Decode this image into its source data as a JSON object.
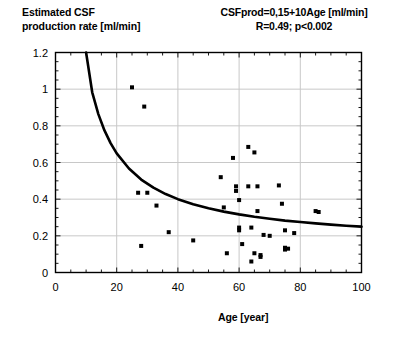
{
  "figure": {
    "ylabel_line1": "Estimated CSF",
    "ylabel_line2": "production rate [ml/min]",
    "ylabel_text": "Estimated CSF\nproduction rate [ml/min]",
    "annotation_line1": "CSFprod=0,15+10Age [ml/min]",
    "annotation_line2": "R=0.49; p<0.002",
    "xlabel": "Age [year]"
  },
  "chart_data": {
    "type": "scatter",
    "title": "",
    "subtitle": "",
    "xlabel": "Age [year]",
    "ylabel": "Estimated CSF production rate [ml/min]",
    "xlim": [
      0,
      100
    ],
    "ylim": [
      0,
      1.2
    ],
    "xticks": [
      0,
      20,
      40,
      60,
      80,
      100
    ],
    "xtick_labels": [
      "0",
      "20",
      "40",
      "60",
      "80",
      "100"
    ],
    "yticks": [
      0,
      0.2,
      0.4,
      0.6,
      0.8,
      1,
      1.2
    ],
    "ytick_labels": [
      "0",
      "0.2",
      "0.4",
      "0.6",
      "0.8",
      "1",
      "1.2"
    ],
    "x_minor_tick_interval": 5,
    "y_minor_tick_interval": 0.05,
    "grid": true,
    "grid_color": "#c8c8c8",
    "frame_color": "#000000",
    "legend": "none",
    "marker_color": "#000000",
    "marker_shape": "square",
    "marker_size_px": 4,
    "annotations": [
      {
        "text": "CSFprod=0,15+10Age [ml/min]",
        "position": "top-right"
      },
      {
        "text": "R=0.49; p<0.002",
        "position": "top-right"
      }
    ],
    "statistics": {
      "R": 0.49,
      "p": "<0.002"
    },
    "points": [
      {
        "x": 25,
        "y": 1.01
      },
      {
        "x": 29,
        "y": 0.905
      },
      {
        "x": 27,
        "y": 0.435
      },
      {
        "x": 30,
        "y": 0.435
      },
      {
        "x": 28,
        "y": 0.145
      },
      {
        "x": 33,
        "y": 0.365
      },
      {
        "x": 37,
        "y": 0.22
      },
      {
        "x": 45,
        "y": 0.175
      },
      {
        "x": 54,
        "y": 0.52
      },
      {
        "x": 55,
        "y": 0.355
      },
      {
        "x": 56,
        "y": 0.105
      },
      {
        "x": 58,
        "y": 0.625
      },
      {
        "x": 59,
        "y": 0.47
      },
      {
        "x": 59,
        "y": 0.445
      },
      {
        "x": 60,
        "y": 0.395
      },
      {
        "x": 60,
        "y": 0.245
      },
      {
        "x": 60,
        "y": 0.23
      },
      {
        "x": 61,
        "y": 0.155
      },
      {
        "x": 63,
        "y": 0.685
      },
      {
        "x": 63,
        "y": 0.47
      },
      {
        "x": 64,
        "y": 0.245
      },
      {
        "x": 64,
        "y": 0.06
      },
      {
        "x": 65,
        "y": 0.655
      },
      {
        "x": 65,
        "y": 0.105
      },
      {
        "x": 66,
        "y": 0.47
      },
      {
        "x": 66,
        "y": 0.335
      },
      {
        "x": 67,
        "y": 0.095
      },
      {
        "x": 67,
        "y": 0.085
      },
      {
        "x": 68,
        "y": 0.205
      },
      {
        "x": 70,
        "y": 0.2
      },
      {
        "x": 73,
        "y": 0.475
      },
      {
        "x": 74,
        "y": 0.375
      },
      {
        "x": 75,
        "y": 0.23
      },
      {
        "x": 75,
        "y": 0.135
      },
      {
        "x": 75,
        "y": 0.125
      },
      {
        "x": 76,
        "y": 0.13
      },
      {
        "x": 78,
        "y": 0.215
      },
      {
        "x": 85,
        "y": 0.335
      },
      {
        "x": 86,
        "y": 0.33
      }
    ],
    "fit_curve": {
      "label": "CSFprod=0,15+10Age [ml/min]",
      "color": "#000000",
      "width_px": 2.6,
      "x_start": 10,
      "x_end": 100,
      "form": "y = 0.15 + 10/x",
      "sample_points": [
        {
          "x": 10,
          "y": 1.2
        },
        {
          "x": 12,
          "y": 0.983
        },
        {
          "x": 14,
          "y": 0.864
        },
        {
          "x": 16,
          "y": 0.775
        },
        {
          "x": 18,
          "y": 0.706
        },
        {
          "x": 20,
          "y": 0.65
        },
        {
          "x": 24,
          "y": 0.567
        },
        {
          "x": 28,
          "y": 0.507
        },
        {
          "x": 32,
          "y": 0.463
        },
        {
          "x": 36,
          "y": 0.428
        },
        {
          "x": 40,
          "y": 0.4
        },
        {
          "x": 45,
          "y": 0.372
        },
        {
          "x": 50,
          "y": 0.35
        },
        {
          "x": 55,
          "y": 0.332
        },
        {
          "x": 60,
          "y": 0.317
        },
        {
          "x": 65,
          "y": 0.304
        },
        {
          "x": 70,
          "y": 0.293
        },
        {
          "x": 75,
          "y": 0.283
        },
        {
          "x": 80,
          "y": 0.275
        },
        {
          "x": 85,
          "y": 0.268
        },
        {
          "x": 90,
          "y": 0.261
        },
        {
          "x": 95,
          "y": 0.255
        },
        {
          "x": 100,
          "y": 0.25
        }
      ]
    }
  }
}
